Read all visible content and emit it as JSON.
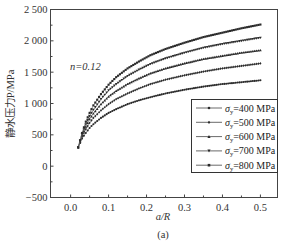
{
  "chart_data": {
    "type": "line",
    "title": "",
    "annotation": "n=0.12",
    "xlabel": "a/R",
    "ylabel": "静水压力P/MPa",
    "caption": "(a)",
    "xlim": [
      -0.053,
      0.545
    ],
    "ylim": [
      -500,
      2500
    ],
    "xticks": [
      0.0,
      0.1,
      0.2,
      0.3,
      0.4,
      0.5
    ],
    "xtick_labels": [
      "0.0",
      "0.1",
      "0.2",
      "0.3",
      "0.4",
      "0.5"
    ],
    "yticks": [
      -500,
      0,
      500,
      1000,
      1500,
      2000,
      2500
    ],
    "ytick_labels": [
      "−500",
      "0",
      "500",
      "1 000",
      "1 500",
      "2 000",
      "2 500"
    ],
    "grid": false,
    "legend_position": "lower right",
    "x": [
      0.02,
      0.03,
      0.04,
      0.05,
      0.06,
      0.08,
      0.1,
      0.12,
      0.15,
      0.18,
      0.21,
      0.25,
      0.3,
      0.35,
      0.4,
      0.45,
      0.5
    ],
    "series": [
      {
        "name": "σy=400 MPa",
        "sigma": "400",
        "marker": "circle",
        "values": [
          300,
          440,
          530,
          610,
          670,
          770,
          850,
          910,
          990,
          1050,
          1100,
          1160,
          1220,
          1270,
          1310,
          1340,
          1370
        ]
      },
      {
        "name": "σy=500 MPa",
        "sigma": "500",
        "marker": "diamond",
        "values": [
          300,
          470,
          590,
          690,
          770,
          890,
          990,
          1070,
          1160,
          1240,
          1310,
          1380,
          1450,
          1510,
          1560,
          1600,
          1640
        ]
      },
      {
        "name": "σy=600 MPa",
        "sigma": "600",
        "marker": "triangle",
        "values": [
          300,
          490,
          630,
          750,
          840,
          990,
          1110,
          1200,
          1310,
          1400,
          1480,
          1560,
          1640,
          1710,
          1760,
          1810,
          1850
        ]
      },
      {
        "name": "σy=700 MPa",
        "sigma": "700",
        "marker": "down-triangle",
        "values": [
          300,
          510,
          670,
          800,
          900,
          1070,
          1210,
          1310,
          1440,
          1540,
          1630,
          1720,
          1810,
          1890,
          1950,
          2000,
          2050
        ]
      },
      {
        "name": "σy=800 MPa",
        "sigma": "800",
        "marker": "square",
        "values": [
          300,
          530,
          710,
          850,
          970,
          1150,
          1300,
          1420,
          1560,
          1670,
          1770,
          1870,
          1970,
          2060,
          2130,
          2200,
          2260
        ]
      }
    ]
  }
}
